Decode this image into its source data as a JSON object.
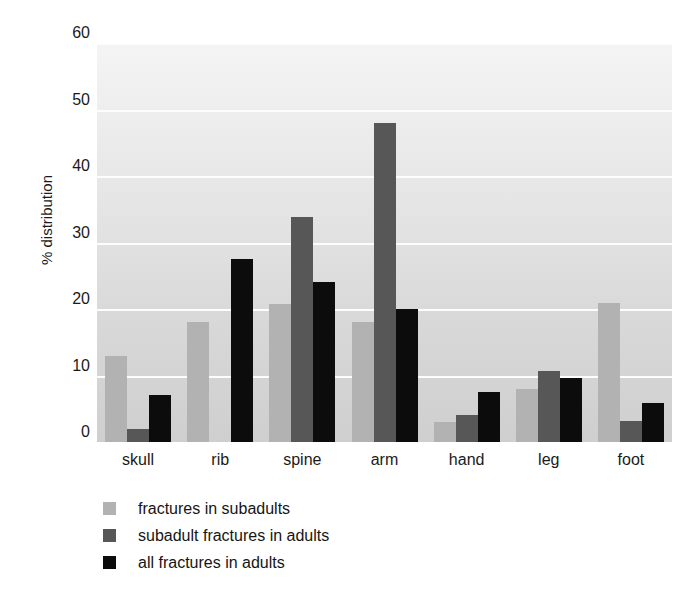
{
  "chart_data": {
    "type": "bar",
    "title": "",
    "subtitle": "",
    "xlabel": "",
    "ylabel": "% distribution",
    "categories": [
      "skull",
      "rib",
      "spine",
      "arm",
      "hand",
      "leg",
      "foot"
    ],
    "series": [
      {
        "name": "fractures in subadults",
        "color": "#b2b2b2",
        "values": [
          13,
          18,
          20.7,
          18,
          3,
          8,
          20.9
        ]
      },
      {
        "name": "subadult fractures in adults",
        "color": "#575757",
        "values": [
          2,
          0,
          33.8,
          48,
          4,
          10.7,
          3.2
        ]
      },
      {
        "name": "all fractures in adults",
        "color": "#0c0c0c",
        "values": [
          7,
          27.5,
          24,
          20,
          7.5,
          9.7,
          5.9
        ]
      }
    ],
    "ylim": [
      0,
      60
    ],
    "yticks": [
      0,
      10,
      20,
      30,
      40,
      50,
      60
    ],
    "ytick_labels": [
      "0",
      "10",
      "20",
      "30",
      "40",
      "50",
      "60"
    ],
    "grid": "horizontal-white-gridlines",
    "legend_position": "below-axes-left",
    "plot_background": "light-gray-vertical-gradient"
  }
}
